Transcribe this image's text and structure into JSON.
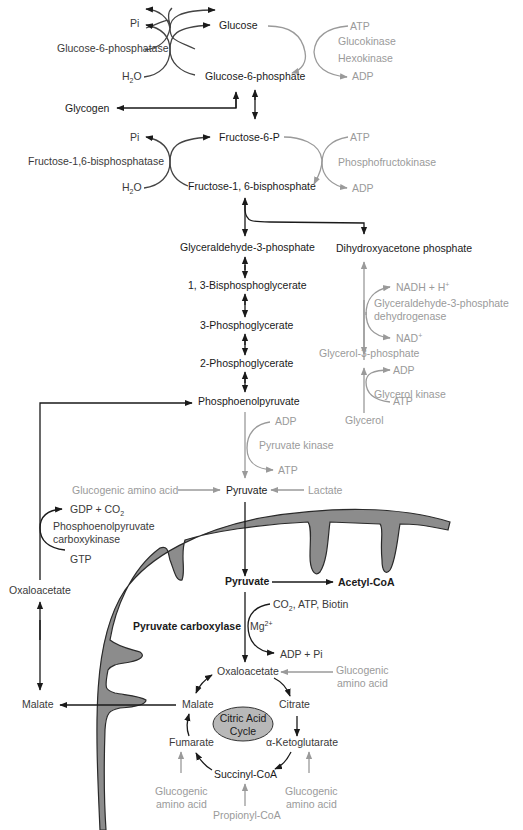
{
  "colors": {
    "main_pathway": "#1a1a1a",
    "side_pathway": "#9a9a9a",
    "mitochondrion_fill": "#8c8c8c",
    "mitochondrion_stroke": "#2a2a2a",
    "tca_ellipse_fill": "#b8b8b8",
    "background": "#ffffff"
  },
  "top": {
    "pi_1": "Pi",
    "glucose": "Glucose",
    "glucose_6_phosphatase": "Glucose-6-phosphatase",
    "h2o_1_main": "H",
    "h2o_1_sub": "2",
    "h2o_1_tail": "O",
    "glucose_6_phosphate": "Glucose-6-phosphate",
    "atp_1": "ATP",
    "glucokinase": "Glucokinase",
    "hexokinase": "Hexokinase",
    "adp_1": "ADP",
    "glycogen": "Glycogen",
    "pi_2": "Pi",
    "fructose_6_p": "Fructose-6-P",
    "fructose_bisphosphatase": "Fructose-1,6-bisphosphatase",
    "h2o_2_main": "H",
    "h2o_2_sub": "2",
    "h2o_2_tail": "O",
    "fructose_1_6_bisphosphate": "Fructose-1, 6-bisphosphate",
    "atp_2": "ATP",
    "phosphofructokinase": "Phosphofructokinase",
    "adp_2": "ADP"
  },
  "glycolysis": {
    "glyceraldehyde_3_phosphate": "Glyceraldehyde-3-phosphate",
    "bisphosphoglycerate": "1, 3-Bisphosphoglycerate",
    "phosphoglycerate_3": "3-Phosphoglycerate",
    "phosphoglycerate_2": "2-Phosphoglycerate",
    "phosphoenolpyruvate": "Phosphoenolpyruvate",
    "adp": "ADP",
    "pyruvate_kinase": "Pyruvate kinase",
    "atp": "ATP",
    "glucogenic_amino_acid": "Glucogenic amino acid",
    "pyruvate": "Pyruvate",
    "lactate": "Lactate"
  },
  "glycerol_branch": {
    "dihydroxyacetone_phosphate": "Dihydroxyacetone phosphate",
    "nadh": "NADH + H",
    "nadh_sup": "+",
    "g3p_dehydrogenase_1": "Glyceraldehyde-3-phosphate",
    "g3p_dehydrogenase_2": "dehydrogenase",
    "nad": "NAD",
    "nad_sup": "+",
    "glycerol_3_phosphate": "Glycerol-3-phosphate",
    "adp": "ADP",
    "glycerol_kinase": "Glycerol kinase",
    "atp": "ATP",
    "glycerol": "Glycerol"
  },
  "pepck": {
    "gdp_co2_main": "GDP + CO",
    "gdp_co2_sub": "2",
    "enzyme_1": "Phosphoenolpyruvate",
    "enzyme_2": "carboxykinase",
    "gtp": "GTP",
    "oxaloacetate": "Oxaloacetate",
    "malate": "Malate"
  },
  "mitochondrion": {
    "pyruvate": "Pyruvate",
    "acetyl_coa": "Acetyl-CoA",
    "pyruvate_carboxylase": "Pyruvate carboxylase",
    "cofactors_main": "CO",
    "cofactors_sub": "2",
    "cofactors_tail": ", ATP, Biotin",
    "mg_main": "Mg",
    "mg_sup": "2+",
    "adp_pi": "ADP + Pi",
    "oxaloacetate": "Oxaloacetate",
    "glucogenic_1_a": "Glucogenic",
    "glucogenic_1_b": "amino acid",
    "citrate": "Citrate",
    "malate": "Malate",
    "cycle_1": "Citric Acid",
    "cycle_2": "Cycle",
    "fumarate": "Fumarate",
    "alpha_ketoglutarate": "α-Ketoglutarate",
    "succinyl_coa": "Succinyl-CoA",
    "glucogenic_2_a": "Glucogenic",
    "glucogenic_2_b": "amino acid",
    "glucogenic_3_a": "Glucogenic",
    "glucogenic_3_b": "amino acid",
    "propionyl_coa": "Propionyl-CoA"
  }
}
